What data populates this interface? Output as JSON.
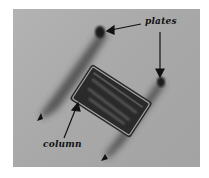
{
  "figure": {
    "background_color": "#a9a9a9",
    "labels": {
      "plates": "plates",
      "column": "column"
    }
  }
}
